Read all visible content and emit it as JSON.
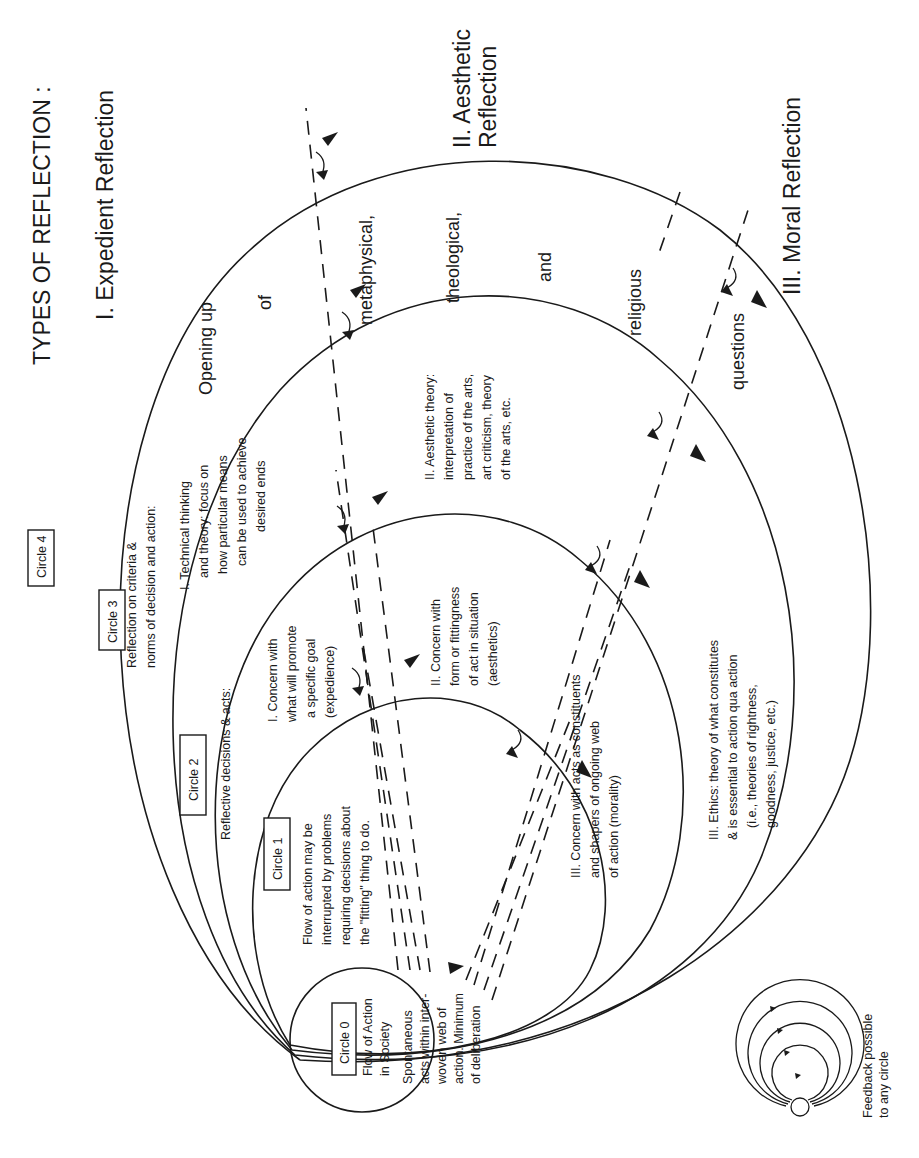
{
  "title": "TYPES OF REFLECTION :",
  "reflection_types": [
    {
      "label": "I.  Expedient Reflection"
    },
    {
      "label_line1": "II. Aesthetic",
      "label_line2": "Reflection"
    },
    {
      "label": "III. Moral Reflection"
    }
  ],
  "outer_band_words": [
    "Opening up",
    "of",
    "metaphysical,",
    "theological,",
    "and",
    "religious",
    "questions"
  ],
  "circles": {
    "c0": {
      "label": "Circle 0",
      "heading": [
        "Flow of Action",
        "in Society"
      ],
      "body": [
        "Spontaneous",
        "acts within inter-",
        "woven web of",
        "action.  Minimum",
        "of deliberation"
      ]
    },
    "c1": {
      "label": "Circle 1",
      "body": [
        "Flow of action may be",
        "interrupted by problems",
        "requiring decisions about",
        "the \"fitting\" thing to do."
      ]
    },
    "c2": {
      "label": "Circle 2",
      "heading": "Reflective decisions & acts:",
      "items": [
        [
          "I.  Concern with",
          "what will promote",
          "a specific goal",
          "(expedience)"
        ],
        [
          "II.  Concern with",
          "form or fittingness",
          "of act in situation",
          "(aesthetics)"
        ],
        [
          "III.  Concern with acts as constituents",
          "and shapers of ongoing web",
          "of action (morality)"
        ]
      ]
    },
    "c3": {
      "label": "Circle 3",
      "heading": [
        "Reflection on criteria &",
        "norms of decision and action:"
      ],
      "items": [
        [
          "I.  Technical thinking",
          "and theory:  focus on",
          "how particular means",
          "can be used to achieve",
          "desired ends"
        ],
        [
          "II.  Aesthetic theory:",
          "interpretation of",
          "practice of the arts,",
          "art criticism, theory",
          "of the arts, etc."
        ],
        [
          "III.  Ethics:  theory of what constitutes",
          "& is essential to action qua action",
          "(i.e., theories of rightness,",
          "goodness, justice, etc.)"
        ]
      ]
    },
    "c4": {
      "label": "Circle 4"
    }
  },
  "legend": {
    "text": [
      "Feedback possible",
      "to any circle"
    ],
    "icon": "nested-feedback-circles-icon"
  },
  "colors": {
    "ink": "#1a1a1a",
    "background": "#ffffff"
  }
}
